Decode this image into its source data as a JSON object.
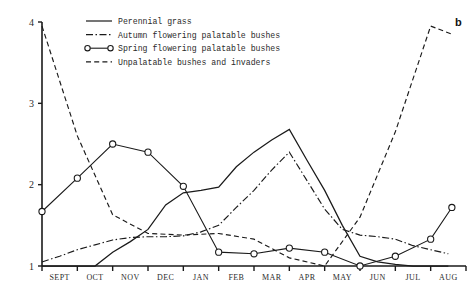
{
  "panel_label": "b",
  "chart_data": {
    "type": "line",
    "title": "",
    "xlabel": "",
    "ylabel": "",
    "grid": false,
    "legend_position": "top-center",
    "ylim": [
      1,
      4
    ],
    "yticks": [
      1,
      2,
      3,
      4
    ],
    "ytick_labels": [
      "1",
      "2",
      "3",
      "4"
    ],
    "categories": [
      "SEPT",
      "OCT",
      "NOV",
      "DEC",
      "JAN",
      "FEB",
      "MAR",
      "APR",
      "MAY",
      "JUN",
      "JUL",
      "AUG"
    ],
    "x_positions": [
      0,
      1,
      2,
      3,
      4,
      5,
      6,
      7,
      8,
      9,
      10,
      11
    ],
    "series": [
      {
        "name": "Perennial grass",
        "style": "solid",
        "markers": false,
        "x": [
          0,
          0.5,
          1,
          1.5,
          2,
          2.5,
          3,
          3.5,
          4,
          4.5,
          5,
          5.5,
          6,
          6.5,
          7,
          7.5,
          8,
          8.5,
          9,
          9.5,
          10,
          10.5,
          11,
          11.5
        ],
        "values": [
          1.0,
          1.0,
          1.0,
          1.0,
          1.17,
          1.3,
          1.45,
          1.75,
          1.9,
          1.93,
          1.97,
          2.22,
          2.4,
          2.55,
          2.68,
          2.3,
          1.93,
          1.5,
          1.12,
          1.05,
          1.02,
          1.0,
          1.0,
          1.0
        ]
      },
      {
        "name": "Autumn flowering palatable bushes",
        "style": "dashdot",
        "markers": false,
        "x": [
          0,
          0.5,
          1,
          1.5,
          2,
          2.5,
          3,
          3.5,
          4,
          4.5,
          5,
          5.5,
          6,
          6.5,
          7,
          7.5,
          8,
          8.5,
          9,
          9.5,
          10,
          10.5,
          11,
          11.5
        ],
        "values": [
          1.05,
          1.12,
          1.2,
          1.26,
          1.32,
          1.35,
          1.36,
          1.36,
          1.37,
          1.42,
          1.5,
          1.72,
          1.93,
          2.18,
          2.4,
          2.05,
          1.7,
          1.45,
          1.38,
          1.36,
          1.33,
          1.25,
          1.2,
          1.15
        ]
      },
      {
        "name": "Spring flowering palatable bushes",
        "style": "circle",
        "markers": true,
        "x": [
          0,
          1,
          2,
          3,
          4,
          5,
          6,
          7,
          8,
          9,
          10,
          11,
          11.6
        ],
        "values": [
          1.67,
          2.08,
          2.5,
          2.4,
          1.98,
          1.17,
          1.15,
          1.22,
          1.17,
          1.0,
          1.12,
          1.33,
          1.72
        ]
      },
      {
        "name": "Unpalatable bushes and invaders",
        "style": "dashed",
        "markers": false,
        "x": [
          0,
          1,
          2,
          3,
          4,
          5,
          6,
          7,
          8,
          9,
          10,
          11,
          11.6
        ],
        "values": [
          3.95,
          2.6,
          1.63,
          1.4,
          1.38,
          1.4,
          1.33,
          1.1,
          1.0,
          1.6,
          2.65,
          3.95,
          3.85
        ]
      }
    ]
  },
  "legend": {
    "items": [
      {
        "label": "Perennial grass",
        "style": "solid"
      },
      {
        "label": "Autumn flowering palatable bushes",
        "style": "dashdot"
      },
      {
        "label": "Spring flowering palatable bushes",
        "style": "circle"
      },
      {
        "label": "Unpalatable bushes and invaders",
        "style": "dashed"
      }
    ]
  }
}
